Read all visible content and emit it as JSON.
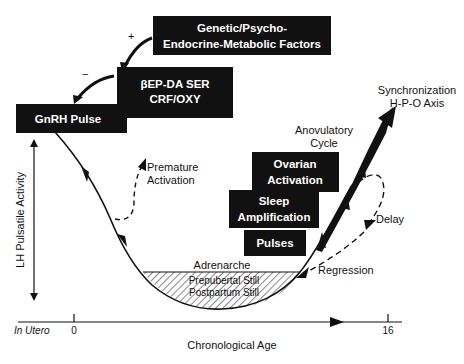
{
  "diagram": {
    "boxes": {
      "genetic": {
        "line1": "Genetic/Psycho-",
        "line2": "Endocrine-Metabolic Factors"
      },
      "neuro": {
        "line1": "βEP-DA SER",
        "line2": "CRF/OXY"
      },
      "gnrh": {
        "label": "GnRH Pulse"
      },
      "ovarian": {
        "line1": "Ovarian",
        "line2": "Activation"
      },
      "sleep": {
        "line1": "Sleep",
        "line2": "Amplification"
      },
      "pulses": {
        "label": "Pulses"
      }
    },
    "signs": {
      "plus": "+",
      "minus": "−"
    },
    "annotations": {
      "premature": {
        "line1": "Premature",
        "line2": "Activation"
      },
      "synchronization": {
        "line1": "Synchronization",
        "line2": "H-P-O Axis"
      },
      "anovulatory": {
        "line1": "Anovulatory",
        "line2": "Cycle"
      },
      "delay": "Delay",
      "regression": "Regression",
      "adrenarche": "Adrenarche",
      "prepubertal": "Prepubertal Still",
      "postpartum": "Postpartum Still"
    },
    "axes": {
      "y_label": "LH Pulsatile Activity",
      "x_label": "Chronological Age",
      "x_start": "In Utero",
      "tick_0": "0",
      "tick_16": "16"
    },
    "colors": {
      "ink": "#111111",
      "paper": "#ffffff"
    }
  }
}
